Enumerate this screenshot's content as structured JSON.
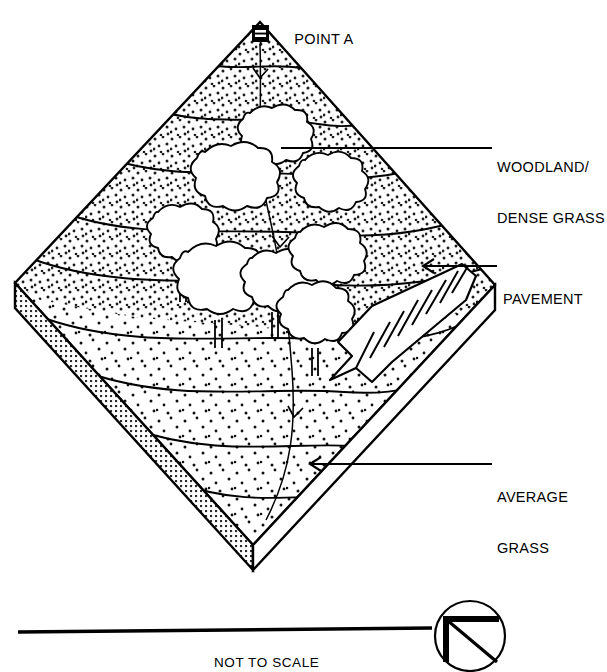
{
  "figure": {
    "type": "isometric-block-diagram"
  },
  "markers": {
    "point_a": {
      "label": "POINT A",
      "icon": "survey-monument-icon",
      "x": 260,
      "y": 35
    }
  },
  "callouts": [
    {
      "id": "woodland",
      "line1": "WOODLAND/",
      "line2": "DENSE GRASS",
      "leader_from_x": 281,
      "leader_from_y": 148,
      "leader_to_x": 492,
      "text_x": 497,
      "text_y": 133,
      "arrowhead": false
    },
    {
      "id": "pavement",
      "line1": "PAVEMENT",
      "line2": "",
      "leader_from_x": 424,
      "leader_from_y": 266,
      "leader_to_x": 497,
      "text_x": 503,
      "text_y": 258,
      "arrowhead": true
    },
    {
      "id": "average-grass",
      "line1": "AVERAGE",
      "line2": "GRASS",
      "leader_from_x": 311,
      "leader_from_y": 464,
      "leader_to_x": 492,
      "text_x": 497,
      "text_y": 455,
      "arrowhead": true
    }
  ],
  "scale": {
    "note": "NOT TO SCALE",
    "bar_x1": 18,
    "bar_x2": 432,
    "bar_y": 631,
    "note_x": 225,
    "note_y": 644
  },
  "north_symbol": {
    "name": "north-arrow-icon",
    "cx": 470,
    "cy": 636,
    "r": 35
  },
  "colors": {
    "ink": "#000000",
    "paper": "#ffffff",
    "stipple": "#1a1a1a",
    "hatch": "#333333"
  },
  "terrain": {
    "contour_count": 9,
    "tree_count": 8,
    "parking_stalls": 9,
    "top_face_texture": "sparse-stipple",
    "left_face_texture": "cross-hatch",
    "right_face_texture": "blank"
  }
}
